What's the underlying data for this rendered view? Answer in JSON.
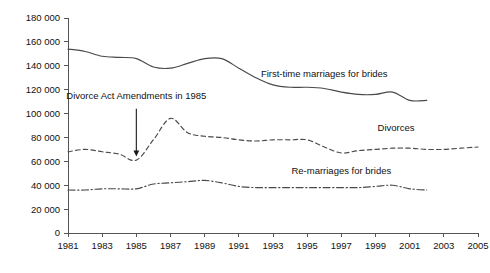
{
  "chart_data": {
    "type": "line",
    "title": "",
    "subtitle": "",
    "xlabel": "",
    "ylabel": "",
    "xlim": [
      1981,
      2005
    ],
    "ylim": [
      0,
      180000
    ],
    "grid": false,
    "legend_position": "inline-labels",
    "x_tick_labels": [
      "1981",
      "1983",
      "1985",
      "1987",
      "1989",
      "1991",
      "1993",
      "1995",
      "1997",
      "1999",
      "2001",
      "2003",
      "2005"
    ],
    "x_ticks": [
      1981,
      1983,
      1985,
      1987,
      1989,
      1991,
      1993,
      1995,
      1997,
      1999,
      2001,
      2003,
      2005
    ],
    "y_tick_labels": [
      "0",
      "20 000",
      "40 000",
      "60 000",
      "80 000",
      "100 000",
      "120 000",
      "140 000",
      "160 000",
      "180 000"
    ],
    "y_ticks": [
      0,
      20000,
      40000,
      60000,
      80000,
      100000,
      120000,
      140000,
      160000,
      180000
    ],
    "series": [
      {
        "name": "First-time marriages for brides",
        "label": "First-time marriages for brides",
        "style": "solid",
        "color": "#4a4a4a",
        "label_x": 1996.0,
        "label_y": 131000,
        "x": [
          1981,
          1982,
          1983,
          1984,
          1985,
          1986,
          1987,
          1988,
          1989,
          1990,
          1991,
          1992,
          1993,
          1994,
          1995,
          1996,
          1997,
          1998,
          1999,
          2000,
          2001,
          2002
        ],
        "values": [
          154000,
          152000,
          148000,
          147000,
          146000,
          139000,
          138000,
          142000,
          146000,
          146000,
          138000,
          130000,
          124000,
          122000,
          122000,
          121000,
          118000,
          116000,
          116000,
          118000,
          111000,
          111000
        ]
      },
      {
        "name": "Divorces",
        "label": "Divorces",
        "style": "dashed",
        "color": "#4a4a4a",
        "label_x": 2000.2,
        "label_y": 85000,
        "x": [
          1981,
          1982,
          1983,
          1984,
          1985,
          1986,
          1987,
          1988,
          1989,
          1990,
          1991,
          1992,
          1993,
          1994,
          1995,
          1996,
          1997,
          1998,
          1999,
          2000,
          2001,
          2002,
          2003,
          2004,
          2005
        ],
        "values": [
          68000,
          70000,
          68000,
          66000,
          61000,
          78000,
          96000,
          84000,
          81000,
          80000,
          78000,
          77000,
          78000,
          78000,
          78000,
          72000,
          67000,
          69000,
          70000,
          71000,
          71000,
          70000,
          70000,
          71000,
          72000
        ]
      },
      {
        "name": "Re-marriages for brides",
        "label": "Re-marriages for brides",
        "style": "dashdot",
        "color": "#4a4a4a",
        "label_x": 1997.0,
        "label_y": 49000,
        "x": [
          1981,
          1982,
          1983,
          1984,
          1985,
          1986,
          1987,
          1988,
          1989,
          1990,
          1991,
          1992,
          1993,
          1994,
          1995,
          1996,
          1997,
          1998,
          1999,
          2000,
          2001,
          2002
        ],
        "values": [
          36000,
          36000,
          37000,
          37000,
          37000,
          41000,
          42000,
          43000,
          44000,
          42000,
          39000,
          38000,
          38000,
          38000,
          38000,
          38000,
          38000,
          38000,
          39000,
          40000,
          37000,
          36000
        ]
      }
    ],
    "annotations": [
      {
        "name": "divorce-act-annotation",
        "text": "Divorce Act Amendments in 1985",
        "text_x": 1985.0,
        "text_y": 112000,
        "arrow_from_x": 1985.0,
        "arrow_from_y": 104000,
        "arrow_to_x": 1985.0,
        "arrow_to_y": 64000
      }
    ]
  }
}
